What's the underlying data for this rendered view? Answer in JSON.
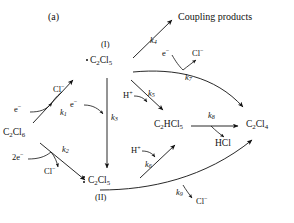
{
  "panel": {
    "label": "(a)"
  },
  "species": {
    "hexachloroethane": "C2Cl6",
    "radical": "C2Cl5",
    "radical_roman": "(I)",
    "anion": "C2Cl5",
    "anion_roman": "(II)",
    "pentachloroethane": "C2HCl5",
    "tetrachloroethylene": "C2Cl4",
    "hydrogen_chloride": "HCl",
    "coupling_products": "Coupling products"
  },
  "rate_constants": {
    "k1": "k1",
    "k2": "k2",
    "k3": "k3",
    "k4": "k4",
    "k5": "k5",
    "k6": "k6",
    "k7": "k7",
    "k8": "k8",
    "k9": "k9"
  },
  "reagents": {
    "electron": "e",
    "two_electron": "2e",
    "chloride_1": "Cl",
    "chloride_2": "Cl",
    "chloride_3": "Cl",
    "chloride_4": "Cl",
    "proton_1": "H",
    "proton_2": "H",
    "electron_k3": "e",
    "electron_k7": "e"
  },
  "colors": {
    "ink": "#111111",
    "stroke": "#222222"
  }
}
